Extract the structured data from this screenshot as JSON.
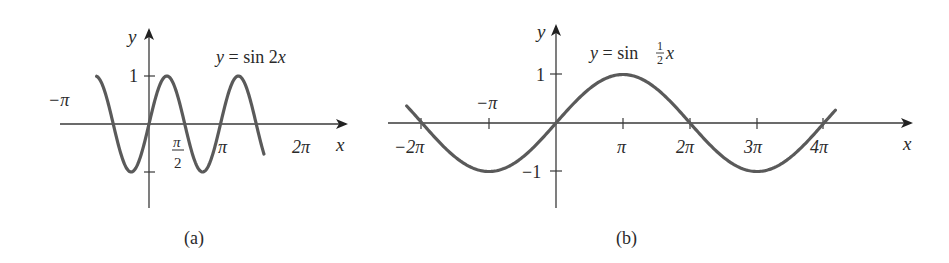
{
  "chart_data": [
    {
      "type": "line",
      "panel_label": "(a)",
      "title": "y = sin 2x",
      "xlabel": "x",
      "ylabel": "y",
      "x_tick_labels": [
        "−π",
        "π/2",
        "π",
        "2π"
      ],
      "y_tick_labels": [
        "1",
        "−1"
      ],
      "function": "sin(2x)",
      "x_range": [
        -2.3,
        5.05
      ],
      "ylim": [
        -1,
        1
      ],
      "period": "π",
      "zeros": [
        "−π",
        "−π/2",
        "0",
        "π/2",
        "π",
        "3π/2",
        "2π"
      ],
      "grid": false,
      "legend": "none"
    },
    {
      "type": "line",
      "panel_label": "(b)",
      "title": "y = sin ½x",
      "xlabel": "x",
      "ylabel": "y",
      "x_tick_labels": [
        "−2π",
        "−π",
        "π",
        "2π",
        "3π",
        "4π"
      ],
      "y_tick_labels": [
        "1",
        "−1"
      ],
      "function": "sin(x/2)",
      "x_range": [
        -7.0,
        13.1
      ],
      "ylim": [
        -1,
        1
      ],
      "period": "4π",
      "zeros": [
        "−2π",
        "0",
        "2π",
        "4π"
      ],
      "grid": false,
      "legend": "none"
    }
  ],
  "panel_a": {
    "caption": "(a)",
    "equation_lhs": "y = sin 2",
    "equation_var": "x",
    "axis_x": "x",
    "axis_y": "y",
    "tick_neg_pi": "−π",
    "tick_pi_over_2_num": "π",
    "tick_pi_over_2_den": "2",
    "tick_pi": "π",
    "tick_2pi": "2π",
    "tick_y1": "1"
  },
  "panel_b": {
    "caption": "(b)",
    "equation_lhs": "y = sin ",
    "equation_frac_num": "1",
    "equation_frac_den": "2",
    "equation_var": "x",
    "axis_x": "x",
    "axis_y": "y",
    "tick_neg_2pi": "−2π",
    "tick_neg_pi": "−π",
    "tick_pi": "π",
    "tick_2pi": "2π",
    "tick_3pi": "3π",
    "tick_4pi": "4π",
    "tick_y1": "1",
    "tick_yneg1": "−1"
  },
  "colors": {
    "curve": "#5a5a5a",
    "axis": "#3a3a3a",
    "text": "#2a2a2a"
  }
}
